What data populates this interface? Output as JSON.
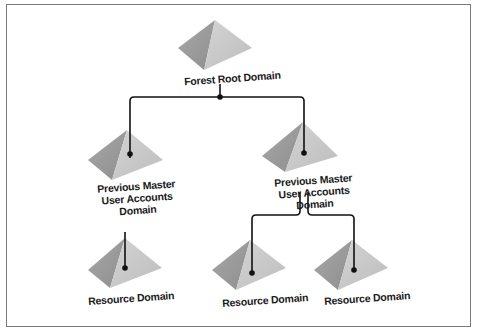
{
  "diagram": {
    "type": "forest-domain-hierarchy",
    "nodes": [
      {
        "id": "root",
        "label": "Forest Root Domain"
      },
      {
        "id": "master-left",
        "label_lines": [
          "Previous Master",
          "User Accounts",
          "Domain"
        ]
      },
      {
        "id": "master-right",
        "label_lines": [
          "Previous Master",
          "User Accounts",
          "Domain"
        ]
      },
      {
        "id": "resource-left",
        "label": "Resource Domain"
      },
      {
        "id": "resource-mid",
        "label": "Resource Domain"
      },
      {
        "id": "resource-right",
        "label": "Resource Domain"
      }
    ],
    "edges": [
      [
        "root",
        "master-left"
      ],
      [
        "root",
        "master-right"
      ],
      [
        "master-left",
        "resource-left"
      ],
      [
        "master-right",
        "resource-mid"
      ],
      [
        "master-right",
        "resource-right"
      ]
    ],
    "colors": {
      "pyramid_light": "#c8c8c8",
      "pyramid_dark": "#9a9a9a",
      "line": "#111111",
      "frame": "#7a7a7a"
    }
  }
}
